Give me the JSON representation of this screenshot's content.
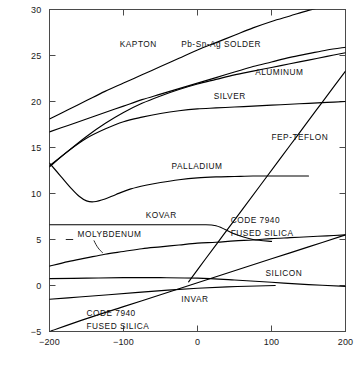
{
  "chart_data": {
    "type": "line",
    "title": "",
    "xlabel": "TEMPERATURE (°C)",
    "ylabel": "COEFFICIENT OF EXPANSION (10⁻⁶/°C)",
    "xlim": [
      -200,
      200
    ],
    "ylim": [
      -5,
      30
    ],
    "xticks": [
      -200,
      -100,
      0,
      100,
      200
    ],
    "xtick_labels": [
      "−200",
      "−100",
      "0",
      "100",
      "200"
    ],
    "yticks": [
      -5,
      0,
      5,
      10,
      15,
      20,
      25,
      30
    ],
    "ytick_labels": [
      "−5",
      "0",
      "5",
      "10",
      "15",
      "20",
      "25",
      "30"
    ],
    "grid": false,
    "legend": "inline-labels",
    "series": [
      {
        "name": "KAPTON",
        "label": "KAPTON",
        "label_x": -105,
        "label_y": 26.3,
        "x": [
          -200,
          -175,
          -150,
          -125,
          -100,
          -75,
          -50,
          -25,
          0,
          25,
          50,
          75,
          100,
          125,
          150,
          175,
          200
        ],
        "y": [
          18.1,
          19.1,
          20.1,
          21.1,
          22.0,
          22.9,
          23.8,
          24.7,
          25.6,
          26.4,
          27.2,
          28.0,
          28.7,
          29.3,
          29.9,
          30.4,
          30.8
        ]
      },
      {
        "name": "Pb-Sn-Ag SOLDER",
        "label": "Pb-Sn-Ag SOLDER",
        "label_x": -22,
        "label_y": 26.2,
        "x": [
          -200,
          -175,
          -150,
          -125,
          -100,
          -75,
          -50,
          -25,
          0,
          25,
          50,
          75,
          100,
          125,
          150,
          175,
          200
        ],
        "y": [
          16.7,
          17.4,
          18.1,
          18.8,
          19.5,
          20.2,
          20.8,
          21.4,
          22.0,
          22.6,
          23.2,
          23.8,
          24.3,
          24.8,
          25.2,
          25.6,
          25.9
        ]
      },
      {
        "name": "ALUMINUM",
        "label": "ALUMINUM",
        "label_x": 78,
        "label_y": 23.2,
        "x": [
          -200,
          -175,
          -150,
          -125,
          -100,
          -75,
          -50,
          -25,
          0,
          25,
          50,
          75,
          100,
          125,
          150,
          175,
          200
        ],
        "y": [
          12.9,
          14.6,
          16.2,
          17.6,
          18.8,
          19.8,
          20.6,
          21.3,
          21.9,
          22.4,
          22.9,
          23.3,
          23.7,
          24.1,
          24.5,
          24.9,
          25.3
        ]
      },
      {
        "name": "SILVER",
        "label": "SILVER",
        "label_x": 22,
        "label_y": 20.6,
        "x": [
          -200,
          -175,
          -150,
          -125,
          -100,
          -75,
          -50,
          -25,
          0,
          25,
          50,
          75,
          100,
          125,
          150,
          175,
          200
        ],
        "y": [
          13.0,
          14.6,
          16.0,
          17.0,
          17.8,
          18.3,
          18.7,
          19.0,
          19.2,
          19.3,
          19.4,
          19.5,
          19.6,
          19.7,
          19.8,
          19.9,
          20.0
        ]
      },
      {
        "name": "FEP-TEFLON",
        "label": "FEP-TEFLON",
        "label_x": 100,
        "label_y": 16.1,
        "x": [
          -12,
          10,
          35,
          60,
          85,
          110,
          135,
          160,
          185,
          200
        ],
        "y": [
          0.4,
          2.8,
          5.5,
          8.2,
          10.9,
          13.6,
          16.3,
          19.0,
          21.7,
          23.3
        ]
      },
      {
        "name": "PALLADIUM",
        "label": "PALLADIUM",
        "label_x": -35,
        "label_y": 13.0,
        "x": [
          -200,
          -185,
          -170,
          -160,
          -150,
          -140,
          -125,
          -110,
          -90,
          -70,
          -50,
          -25,
          0,
          25,
          50,
          75,
          100,
          125,
          150
        ],
        "y": [
          13.3,
          11.9,
          10.5,
          9.7,
          9.2,
          9.1,
          9.4,
          9.9,
          10.5,
          10.9,
          11.2,
          11.5,
          11.7,
          11.8,
          11.85,
          11.9,
          11.9,
          11.9,
          11.9
        ]
      },
      {
        "name": "KOVAR",
        "label": "KOVAR",
        "label_x": -70,
        "label_y": 7.7,
        "x": [
          -200,
          -150,
          -100,
          -50,
          0,
          25,
          50,
          75,
          100
        ],
        "y": [
          6.6,
          6.6,
          6.6,
          6.6,
          6.6,
          6.5,
          5.6,
          5.0,
          4.8
        ]
      },
      {
        "name": "MOLYBDENUM",
        "label": "MOLYBDENUM",
        "label_x": -162,
        "label_y": 5.6,
        "x": [
          -200,
          -175,
          -150,
          -125,
          -100,
          -75,
          -50,
          -25,
          0,
          25,
          50,
          75,
          100,
          125,
          150,
          175,
          200
        ],
        "y": [
          2.1,
          2.6,
          3.0,
          3.4,
          3.7,
          4.0,
          4.2,
          4.4,
          4.6,
          4.7,
          4.85,
          4.95,
          5.1,
          5.2,
          5.3,
          5.4,
          5.5
        ]
      },
      {
        "name": "CODE 7940 FUSED SILICA (rising)",
        "label": "CODE 7940 FUSED SILICA",
        "label_x": 45,
        "label_y": 7.1,
        "label_line2_offset": 1.35,
        "x": [
          -200,
          -150,
          -100,
          -50,
          0,
          50,
          100,
          150,
          200
        ],
        "y": [
          -5.0,
          -3.6,
          -2.3,
          -1.0,
          0.3,
          1.6,
          2.9,
          4.2,
          5.5
        ]
      },
      {
        "name": "SILICON",
        "label": "SILICON",
        "label_x": 92,
        "label_y": 1.35,
        "x": [
          -200,
          -150,
          -100,
          -50,
          0,
          50,
          100,
          150,
          200
        ],
        "y": [
          0.75,
          0.8,
          0.85,
          0.85,
          0.8,
          0.6,
          0.35,
          0.1,
          -0.1
        ]
      },
      {
        "name": "INVAR",
        "label": "INVAR",
        "label_x": -22,
        "label_y": -1.5,
        "x": [
          -200,
          -160,
          -120,
          -80,
          -40,
          0,
          40,
          80,
          105
        ],
        "y": [
          -1.5,
          -1.25,
          -1.0,
          -0.75,
          -0.5,
          -0.3,
          -0.15,
          -0.05,
          0.0
        ]
      },
      {
        "name": "CODE 7940 FUSED SILICA (lower label)",
        "label": "CODE 7940 FUSED SILICA",
        "label_x": -150,
        "label_y": -3.0,
        "label_line2_offset": 1.35,
        "x": [],
        "y": []
      }
    ]
  }
}
